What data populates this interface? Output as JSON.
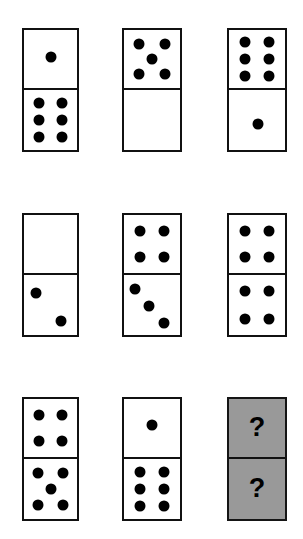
{
  "puzzle": {
    "type": "domino-sequence-puzzle",
    "grid": {
      "rows": 3,
      "columns": 3
    },
    "unknown_marker": "?",
    "colors": {
      "background": "#ffffff",
      "tile_fill": "#ffffff",
      "tile_border": "#111111",
      "pip": "#000000",
      "unknown_fill": "#999999"
    },
    "dominoes": [
      {
        "id": "domino-r1c1",
        "row": 1,
        "column": 1,
        "top": 1,
        "bottom": 6,
        "state": "known",
        "x": 22,
        "y": 28,
        "w": 57,
        "h": 124
      },
      {
        "id": "domino-r1c2",
        "row": 1,
        "column": 2,
        "top": 5,
        "bottom": 0,
        "state": "known",
        "x": 122,
        "y": 28,
        "w": 60,
        "h": 124
      },
      {
        "id": "domino-r1c3",
        "row": 1,
        "column": 3,
        "top": 6,
        "bottom": 1,
        "state": "known",
        "x": 227,
        "y": 28,
        "w": 60,
        "h": 124
      },
      {
        "id": "domino-r2c1",
        "row": 2,
        "column": 1,
        "top": 0,
        "bottom": 2,
        "state": "known",
        "x": 22,
        "y": 213,
        "w": 57,
        "h": 124
      },
      {
        "id": "domino-r2c2",
        "row": 2,
        "column": 2,
        "top": 4,
        "bottom": 3,
        "state": "known",
        "x": 122,
        "y": 213,
        "w": 60,
        "h": 124
      },
      {
        "id": "domino-r2c3",
        "row": 2,
        "column": 3,
        "top": 4,
        "bottom": 4,
        "state": "known",
        "x": 227,
        "y": 213,
        "w": 60,
        "h": 124
      },
      {
        "id": "domino-r3c1",
        "row": 3,
        "column": 1,
        "top": 4,
        "bottom": 5,
        "state": "known",
        "x": 22,
        "y": 397,
        "w": 57,
        "h": 124
      },
      {
        "id": "domino-r3c2",
        "row": 3,
        "column": 2,
        "top": 1,
        "bottom": 6,
        "state": "known",
        "x": 122,
        "y": 397,
        "w": 60,
        "h": 124
      },
      {
        "id": "domino-r3c3",
        "row": 3,
        "column": 3,
        "top": null,
        "bottom": null,
        "state": "unknown",
        "x": 227,
        "y": 397,
        "w": 60,
        "h": 124
      }
    ],
    "pip_layouts": {
      "0": [],
      "1": [
        [
          50,
          50
        ]
      ],
      "2": [
        [
          26,
          29
        ],
        [
          74,
          73
        ]
      ],
      "3": [
        [
          26,
          24
        ],
        [
          50,
          50
        ],
        [
          74,
          77
        ]
      ],
      "4": [
        [
          28,
          27
        ],
        [
          72,
          27
        ],
        [
          28,
          73
        ],
        [
          72,
          73
        ]
      ],
      "5": [
        [
          27,
          24
        ],
        [
          73,
          24
        ],
        [
          50,
          50
        ],
        [
          27,
          76
        ],
        [
          73,
          76
        ]
      ],
      "6": [
        [
          28,
          21
        ],
        [
          72,
          21
        ],
        [
          28,
          50
        ],
        [
          72,
          50
        ],
        [
          28,
          79
        ],
        [
          72,
          79
        ]
      ]
    },
    "pip_layout_overrides": {
      "domino-r1c1-top": [
        [
          50,
          46
        ]
      ],
      "domino-r1c3-bottom": [
        [
          52,
          56
        ]
      ],
      "domino-r2c1-bottom": [
        [
          23,
          30
        ],
        [
          70,
          77
        ]
      ],
      "domino-r2c2-bottom": [
        [
          20,
          23
        ],
        [
          44,
          52
        ],
        [
          72,
          80
        ]
      ],
      "domino-r3c2-top": [
        [
          50,
          44
        ]
      ]
    }
  }
}
